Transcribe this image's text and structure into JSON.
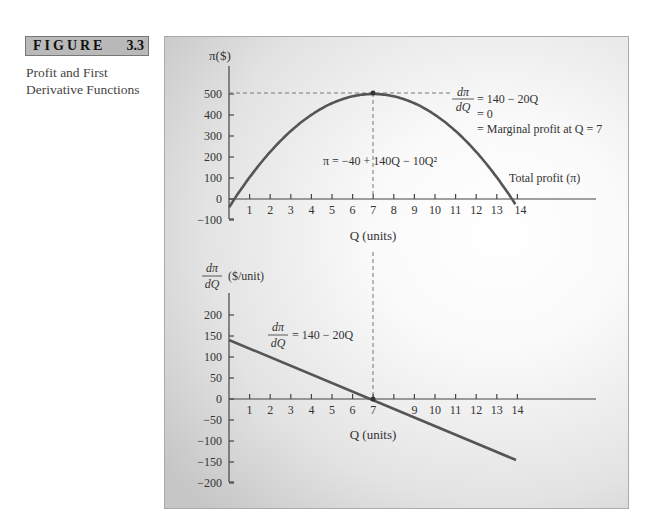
{
  "figure": {
    "label": "FIGURE",
    "number": "3.3",
    "caption_line1": "Profit and First",
    "caption_line2": "Derivative Functions"
  },
  "top_chart": {
    "ylabel": "π($)",
    "xlabel": "Q (units)",
    "y_ticks": [
      "500",
      "400",
      "300",
      "200",
      "100",
      "0",
      "−100"
    ],
    "x_ticks": [
      "1",
      "2",
      "3",
      "4",
      "5",
      "6",
      "7",
      "8",
      "9",
      "10",
      "11",
      "12",
      "13",
      "14"
    ],
    "equation": "π = −40 + 140Q − 10Q²",
    "curve_label": "Total profit (π)",
    "annotation_line1": "= 140 − 20Q",
    "annotation_line2": "= 0",
    "annotation_line3": "= Marginal profit at Q = 7",
    "deriv_num": "dπ",
    "deriv_den": "dQ"
  },
  "bottom_chart": {
    "ylabel_unit": "($/unit)",
    "deriv_num": "dπ",
    "deriv_den": "dQ",
    "xlabel": "Q (units)",
    "y_ticks": [
      "200",
      "150",
      "100",
      "50",
      "0",
      "−50",
      "−100",
      "−150",
      "−200"
    ],
    "x_ticks": [
      "1",
      "2",
      "3",
      "4",
      "5",
      "6",
      "7",
      "9",
      "10",
      "11",
      "12",
      "13",
      "14"
    ],
    "equation_rhs": "= 140 − 20Q"
  },
  "chart_data": [
    {
      "type": "line",
      "title": "Total profit",
      "xlabel": "Q (units)",
      "ylabel": "π($)",
      "xlim": [
        0,
        18
      ],
      "ylim": [
        -100,
        600
      ],
      "grid": false,
      "series": [
        {
          "name": "Total profit (π) = −40 + 140Q − 10Q²",
          "x": [
            0,
            0.3,
            1,
            2,
            3,
            4,
            5,
            6,
            7,
            8,
            9,
            10,
            11,
            12,
            13,
            13.7
          ],
          "y": [
            -40,
            1,
            90,
            200,
            290,
            360,
            410,
            440,
            450,
            440,
            410,
            360,
            290,
            200,
            90,
            -1
          ]
        }
      ],
      "annotations": [
        "Maximum at Q = 7, π ≈ 500 (dashed reference lines)",
        "dπ/dQ = 140 − 20Q = 0 = Marginal profit at Q = 7"
      ]
    },
    {
      "type": "line",
      "title": "First derivative (marginal profit)",
      "xlabel": "Q (units)",
      "ylabel": "dπ/dQ ($/unit)",
      "xlim": [
        0,
        18
      ],
      "ylim": [
        -200,
        250
      ],
      "grid": false,
      "series": [
        {
          "name": "dπ/dQ = 140 − 20Q",
          "x": [
            0,
            7,
            13.8
          ],
          "y": [
            140,
            0,
            -136
          ]
        }
      ]
    }
  ]
}
